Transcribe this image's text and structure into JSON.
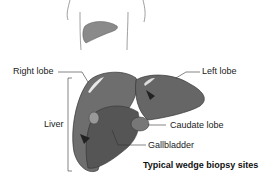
{
  "diagram": {
    "labels": {
      "right_lobe": "Right lobe",
      "left_lobe": "Left lobe",
      "liver": "Liver",
      "caudate_lobe": "Caudate lobe",
      "gallbladder": "Gallbladder"
    },
    "caption": "Typical wedge biopsy sites",
    "colors": {
      "liver": "#6e6e6e",
      "dark": "#4a4a4a",
      "outline": "#333333"
    }
  }
}
